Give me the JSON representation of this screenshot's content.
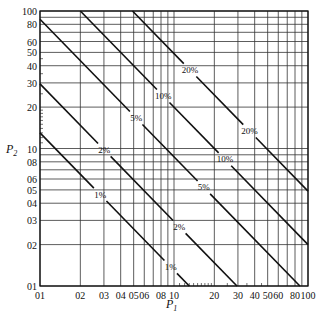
{
  "chart_data": {
    "type": "line",
    "title": "",
    "xlabel": "P",
    "xlabel_sub": "1",
    "ylabel": "P",
    "ylabel_sub": "2",
    "xscale": "log",
    "yscale": "log",
    "xlim": [
      1,
      100
    ],
    "ylim": [
      1,
      100
    ],
    "grid": true,
    "x_tick_labels": [
      {
        "value": 1,
        "label": "01"
      },
      {
        "value": 2,
        "label": "02"
      },
      {
        "value": 3,
        "label": "03"
      },
      {
        "value": 4,
        "label": "04"
      },
      {
        "value": 5,
        "label": "05"
      },
      {
        "value": 6,
        "label": "06"
      },
      {
        "value": 8,
        "label": "08"
      },
      {
        "value": 10,
        "label": "10"
      },
      {
        "value": 20,
        "label": "20"
      },
      {
        "value": 30,
        "label": "30"
      },
      {
        "value": 40,
        "label": "40"
      },
      {
        "value": 50,
        "label": "50"
      },
      {
        "value": 60,
        "label": "60"
      },
      {
        "value": 80,
        "label": "80"
      },
      {
        "value": 100,
        "label": "100"
      }
    ],
    "y_tick_labels": [
      {
        "value": 1,
        "label": "01"
      },
      {
        "value": 2,
        "label": "02"
      },
      {
        "value": 3,
        "label": "03"
      },
      {
        "value": 4,
        "label": "04"
      },
      {
        "value": 5,
        "label": "05"
      },
      {
        "value": 6,
        "label": "06"
      },
      {
        "value": 8,
        "label": "08"
      },
      {
        "value": 10,
        "label": "10"
      },
      {
        "value": 20,
        "label": "20"
      },
      {
        "value": 30,
        "label": "30"
      },
      {
        "value": 40,
        "label": "40"
      },
      {
        "value": 50,
        "label": "50"
      },
      {
        "value": 60,
        "label": "60"
      },
      {
        "value": 80,
        "label": "80"
      },
      {
        "value": 100,
        "label": "100"
      }
    ],
    "gridlines": [
      1,
      2,
      3,
      4,
      5,
      6,
      7,
      8,
      9,
      10,
      20,
      30,
      40,
      50,
      60,
      70,
      80,
      90,
      100
    ],
    "series": [
      {
        "name": "1%",
        "label": "1%",
        "product_P1_P2": 13,
        "points": [
          [
            1,
            13
          ],
          [
            13,
            1
          ]
        ],
        "label_positions": [
          [
            3.7,
            6.0
          ],
          [
            11.8,
            1.7
          ]
        ]
      },
      {
        "name": "2%",
        "label": "2%",
        "product_P1_P2": 29.5,
        "points": [
          [
            1,
            29.5
          ],
          [
            29.5,
            1
          ]
        ],
        "label_positions": [
          [
            3.1,
            10.0
          ],
          [
            11.0,
            2.7
          ]
        ]
      },
      {
        "name": "5%",
        "label": "5%",
        "product_P1_P2": 87,
        "points": [
          [
            1,
            87
          ],
          [
            87,
            1
          ]
        ],
        "label_positions": [
          [
            5.0,
            16.0
          ],
          [
            16.0,
            5.0
          ]
        ]
      },
      {
        "name": "10%",
        "label": "10%",
        "product_P1_P2": 200,
        "points": [
          [
            2,
            100
          ],
          [
            100,
            2
          ]
        ],
        "label_positions": [
          [
            9.0,
            26.0
          ],
          [
            26.0,
            9.0
          ]
        ]
      },
      {
        "name": "20%",
        "label": "20%",
        "product_P1_P2": 490,
        "points": [
          [
            4.9,
            100
          ],
          [
            100,
            4.9
          ]
        ],
        "label_positions": [
          [
            18.0,
            50.0
          ],
          [
            50.0,
            18.0
          ]
        ]
      }
    ]
  }
}
